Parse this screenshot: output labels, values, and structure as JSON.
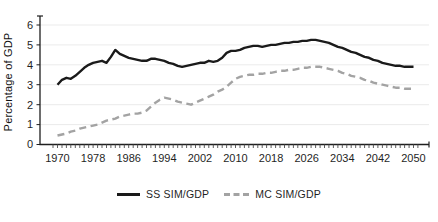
{
  "figure": {
    "background": "#ffffff",
    "grid_color": "#ebebeb",
    "axis_color": "#1f1f1f",
    "tick_label_color": "#1f1f1f"
  },
  "chart_data": {
    "type": "line",
    "title": "",
    "xlabel": "",
    "ylabel": "Percentage of GDP",
    "xlim": [
      1970,
      2050
    ],
    "ylim": [
      0,
      6
    ],
    "grid": "horizontal",
    "legend_position": "bottom-center",
    "x_ticks": [
      1970,
      1978,
      1986,
      1994,
      2002,
      2010,
      2018,
      2026,
      2034,
      2042,
      2050
    ],
    "y_ticks": [
      0,
      1,
      2,
      3,
      4,
      5,
      6
    ],
    "x": [
      1970,
      1971,
      1972,
      1973,
      1974,
      1975,
      1976,
      1977,
      1978,
      1979,
      1980,
      1981,
      1982,
      1983,
      1984,
      1985,
      1986,
      1987,
      1988,
      1989,
      1990,
      1991,
      1992,
      1993,
      1994,
      1995,
      1996,
      1997,
      1998,
      1999,
      2000,
      2001,
      2002,
      2003,
      2004,
      2005,
      2006,
      2007,
      2008,
      2009,
      2010,
      2011,
      2012,
      2013,
      2014,
      2015,
      2016,
      2017,
      2018,
      2019,
      2020,
      2021,
      2022,
      2023,
      2024,
      2025,
      2026,
      2027,
      2028,
      2029,
      2030,
      2031,
      2032,
      2033,
      2034,
      2035,
      2036,
      2037,
      2038,
      2039,
      2040,
      2041,
      2042,
      2043,
      2044,
      2045,
      2046,
      2047,
      2048,
      2049,
      2050
    ],
    "series": [
      {
        "name": "SS SIM/GDP",
        "style": "solid",
        "color": "#1a1a1a",
        "values": [
          3.0,
          3.25,
          3.35,
          3.3,
          3.45,
          3.65,
          3.85,
          4.0,
          4.1,
          4.15,
          4.2,
          4.1,
          4.4,
          4.75,
          4.55,
          4.45,
          4.35,
          4.3,
          4.25,
          4.2,
          4.2,
          4.3,
          4.3,
          4.25,
          4.2,
          4.1,
          4.05,
          3.95,
          3.9,
          3.95,
          4.0,
          4.05,
          4.1,
          4.1,
          4.2,
          4.15,
          4.2,
          4.35,
          4.6,
          4.7,
          4.7,
          4.75,
          4.85,
          4.9,
          4.95,
          4.95,
          4.9,
          4.95,
          5.0,
          5.0,
          5.05,
          5.1,
          5.1,
          5.15,
          5.15,
          5.2,
          5.2,
          5.25,
          5.25,
          5.2,
          5.15,
          5.1,
          5.0,
          4.9,
          4.85,
          4.75,
          4.65,
          4.6,
          4.5,
          4.4,
          4.35,
          4.25,
          4.2,
          4.1,
          4.05,
          4.0,
          3.95,
          3.95,
          3.9,
          3.9,
          3.9
        ]
      },
      {
        "name": "MC SIM/GDP",
        "style": "dashed",
        "color": "#a3a3a3",
        "values": [
          0.45,
          0.5,
          0.55,
          0.65,
          0.7,
          0.8,
          0.85,
          0.9,
          0.95,
          1.0,
          1.1,
          1.2,
          1.25,
          1.3,
          1.4,
          1.45,
          1.5,
          1.55,
          1.55,
          1.6,
          1.7,
          1.9,
          2.1,
          2.25,
          2.35,
          2.3,
          2.25,
          2.15,
          2.1,
          2.05,
          2.0,
          2.1,
          2.2,
          2.3,
          2.4,
          2.5,
          2.65,
          2.75,
          2.9,
          3.1,
          3.3,
          3.4,
          3.45,
          3.5,
          3.5,
          3.55,
          3.55,
          3.6,
          3.6,
          3.65,
          3.7,
          3.7,
          3.75,
          3.75,
          3.8,
          3.85,
          3.85,
          3.9,
          3.9,
          3.9,
          3.85,
          3.8,
          3.75,
          3.7,
          3.6,
          3.55,
          3.45,
          3.4,
          3.35,
          3.25,
          3.2,
          3.1,
          3.05,
          3.0,
          2.95,
          2.9,
          2.85,
          2.85,
          2.8,
          2.8,
          2.8
        ]
      }
    ]
  }
}
